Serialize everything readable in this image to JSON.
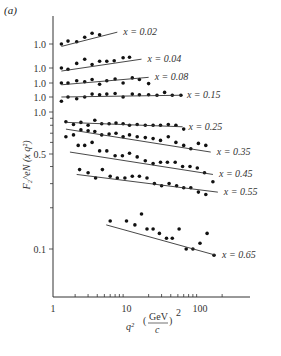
{
  "panel_label": "(a)",
  "chart_data": {
    "type": "scatter",
    "title": "",
    "xlabel": "q² (GeV/c)²",
    "ylabel": "F₂^eN (x q²)",
    "xscale": "log",
    "yscale": "log",
    "xlim": [
      1,
      400
    ],
    "x_ticks": [
      "1",
      "10",
      "100"
    ],
    "y_tick_labels": [
      "1.0",
      "1.0",
      "1.0",
      "1.0",
      "1.0",
      "0.5",
      "0.1"
    ],
    "note": "Upper five series are vertically offset, each with its own 1.0 reference tick",
    "series": [
      {
        "name": "x = 0.02",
        "y_ref_px": 44,
        "points": [
          [
            1.3,
            1.0
          ],
          [
            1.6,
            1.05
          ],
          [
            2.1,
            1.04
          ],
          [
            2.7,
            1.12
          ],
          [
            3.4,
            1.2
          ],
          [
            4.3,
            1.17
          ]
        ],
        "fit": [
          [
            1.3,
            0.96
          ],
          [
            7.5,
            1.22
          ]
        ]
      },
      {
        "name": "x = 0.04",
        "y_ref_px": 68,
        "points": [
          [
            1.3,
            1.0
          ],
          [
            1.6,
            0.98
          ],
          [
            2.1,
            1.08
          ],
          [
            2.7,
            1.16
          ],
          [
            3.4,
            1.06
          ],
          [
            4.3,
            1.12
          ],
          [
            5.4,
            1.12
          ],
          [
            6.8,
            1.13
          ],
          [
            9,
            1.19
          ],
          [
            11,
            1.2
          ]
        ],
        "fit": [
          [
            1.3,
            0.95
          ],
          [
            16,
            1.16
          ]
        ]
      },
      {
        "name": "x = 0.08",
        "y_ref_px": 83,
        "points": [
          [
            1.3,
            1.0
          ],
          [
            1.6,
            1.0
          ],
          [
            2.1,
            1.04
          ],
          [
            2.7,
            1.02
          ],
          [
            3.4,
            1.06
          ],
          [
            4.3,
            0.98
          ],
          [
            5.4,
            1.04
          ],
          [
            7,
            1.07
          ],
          [
            9,
            1.0
          ],
          [
            12,
            1.09
          ],
          [
            15,
            1.06
          ],
          [
            20,
            0.99
          ]
        ],
        "fit": [
          [
            1.3,
            0.97
          ],
          [
            20,
            1.1
          ]
        ]
      },
      {
        "name": "x = 0.15",
        "y_ref_px": 97,
        "points": [
          [
            1.3,
            0.93
          ],
          [
            1.6,
            1.0
          ],
          [
            2.1,
            0.97
          ],
          [
            2.7,
            1.0
          ],
          [
            3.4,
            1.05
          ],
          [
            4.3,
            1.04
          ],
          [
            5.4,
            1.05
          ],
          [
            7,
            1.06
          ],
          [
            9,
            1.0
          ],
          [
            12,
            1.05
          ],
          [
            15,
            1.04
          ],
          [
            20,
            1.04
          ],
          [
            26,
            1.03
          ],
          [
            33,
            1.08
          ],
          [
            42,
            1.03
          ],
          [
            55,
            1.03
          ]
        ],
        "fit": [
          [
            1.3,
            1.0
          ],
          [
            55,
            1.03
          ]
        ]
      },
      {
        "name": "x = 0.25",
        "points": [
          [
            1.5,
            0.85
          ],
          [
            1.9,
            0.81
          ],
          [
            2.4,
            0.84
          ],
          [
            3,
            0.8
          ],
          [
            3.7,
            0.87
          ],
          [
            4.6,
            0.82
          ],
          [
            5.8,
            0.82
          ],
          [
            7.2,
            0.83
          ],
          [
            9,
            0.82
          ],
          [
            11,
            0.8
          ],
          [
            14,
            0.81
          ],
          [
            18,
            0.8
          ],
          [
            23,
            0.8
          ],
          [
            29,
            0.8
          ],
          [
            37,
            0.81
          ],
          [
            47,
            0.8
          ],
          [
            60,
            0.75
          ]
        ],
        "fit": [
          [
            1.5,
            0.84
          ],
          [
            58,
            0.78
          ]
        ]
      },
      {
        "name": "x = 0.35",
        "points": [
          [
            1.5,
            0.66
          ],
          [
            1.9,
            0.68
          ],
          [
            2.4,
            0.74
          ],
          [
            3,
            0.73
          ],
          [
            3.7,
            0.72
          ],
          [
            4.6,
            0.68
          ],
          [
            5.8,
            0.69
          ],
          [
            7.2,
            0.7
          ],
          [
            9,
            0.66
          ],
          [
            11,
            0.68
          ],
          [
            14,
            0.66
          ],
          [
            18,
            0.65
          ],
          [
            23,
            0.64
          ],
          [
            29,
            0.62
          ],
          [
            37,
            0.66
          ],
          [
            47,
            0.6
          ],
          [
            60,
            0.57
          ],
          [
            75,
            0.54
          ],
          [
            95,
            0.59
          ],
          [
            120,
            0.57
          ]
        ],
        "fit": [
          [
            1.5,
            0.75
          ],
          [
            140,
            0.51
          ]
        ]
      },
      {
        "name": "x = 0.45",
        "points": [
          [
            2.2,
            0.57
          ],
          [
            2.7,
            0.57
          ],
          [
            3.4,
            0.6
          ],
          [
            4.3,
            0.52
          ],
          [
            5.4,
            0.52
          ],
          [
            7,
            0.48
          ],
          [
            8.8,
            0.48
          ],
          [
            11,
            0.5
          ],
          [
            14,
            0.47
          ],
          [
            18,
            0.44
          ],
          [
            23,
            0.42
          ],
          [
            29,
            0.43
          ],
          [
            36,
            0.43
          ],
          [
            46,
            0.43
          ],
          [
            58,
            0.4
          ],
          [
            73,
            0.4
          ],
          [
            92,
            0.39
          ],
          [
            115,
            0.36
          ]
        ],
        "fit": [
          [
            1.7,
            0.51
          ],
          [
            150,
            0.35
          ]
        ]
      },
      {
        "name": "x = 0.55",
        "points": [
          [
            2.3,
            0.38
          ],
          [
            3.0,
            0.36
          ],
          [
            3.8,
            0.33
          ],
          [
            4.7,
            0.38
          ],
          [
            6,
            0.34
          ],
          [
            7.5,
            0.33
          ],
          [
            9.5,
            0.33
          ],
          [
            12,
            0.34
          ],
          [
            15,
            0.34
          ],
          [
            19,
            0.33
          ],
          [
            24,
            0.3
          ],
          [
            30,
            0.29
          ],
          [
            38,
            0.3
          ],
          [
            48,
            0.29
          ],
          [
            60,
            0.28
          ],
          [
            75,
            0.28
          ],
          [
            95,
            0.26
          ],
          [
            120,
            0.25
          ],
          [
            150,
            0.31
          ]
        ],
        "fit": [
          [
            2.1,
            0.35
          ],
          [
            175,
            0.26
          ]
        ]
      },
      {
        "name": "x = 0.65",
        "points": [
          [
            6,
            0.16
          ],
          [
            10,
            0.16
          ],
          [
            13,
            0.15
          ],
          [
            16,
            0.18
          ],
          [
            19,
            0.14
          ],
          [
            23,
            0.14
          ],
          [
            28,
            0.13
          ],
          [
            35,
            0.12
          ],
          [
            42,
            0.12
          ],
          [
            52,
            0.14
          ],
          [
            65,
            0.1
          ],
          [
            80,
            0.1
          ],
          [
            100,
            0.11
          ],
          [
            125,
            0.13
          ],
          [
            155,
            0.09
          ]
        ],
        "fit": [
          [
            5.3,
            0.15
          ],
          [
            165,
            0.09
          ]
        ]
      }
    ]
  }
}
